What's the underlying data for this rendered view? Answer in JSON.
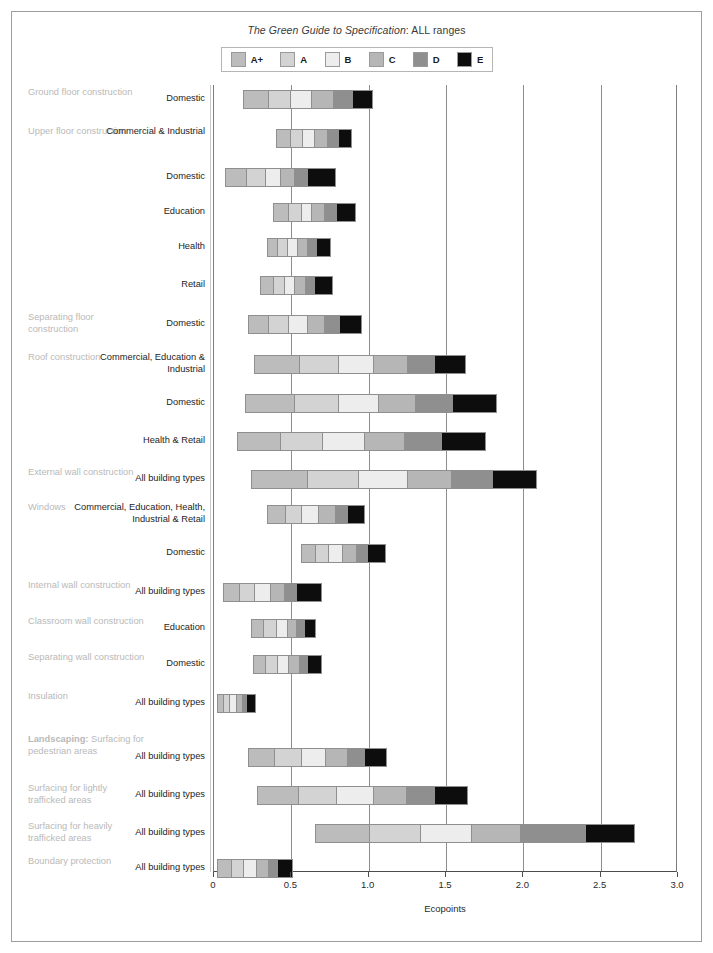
{
  "title": {
    "italic_part": "The Green Guide to Specification",
    "rest_part": ": ALL ranges"
  },
  "legend": {
    "items": [
      {
        "label": "A+",
        "color": "#bcbcbc"
      },
      {
        "label": "A",
        "color": "#d3d3d3"
      },
      {
        "label": "B",
        "color": "#ededed"
      },
      {
        "label": "C",
        "color": "#b6b6b6"
      },
      {
        "label": "D",
        "color": "#8f8f8f"
      },
      {
        "label": "E",
        "color": "#0d0d0d"
      }
    ]
  },
  "axis": {
    "label": "Ecopoints",
    "ticks": [
      "0",
      "0.5",
      "1.0",
      "1.5",
      "2.0",
      "2.5",
      "3.0"
    ],
    "min": 0,
    "max": 3.0
  },
  "chart_data": {
    "type": "bar",
    "orientation": "horizontal",
    "stacked": true,
    "title": "The Green Guide to Specification: ALL ranges",
    "xlabel": "Ecopoints",
    "ylabel": "",
    "xlim": [
      0,
      3.0
    ],
    "grid": true,
    "legend_position": "top",
    "series": [
      {
        "name": "A+",
        "color": "#bcbcbc"
      },
      {
        "name": "A",
        "color": "#d3d3d3"
      },
      {
        "name": "B",
        "color": "#ededed"
      },
      {
        "name": "C",
        "color": "#b6b6b6"
      },
      {
        "name": "D",
        "color": "#8f8f8f"
      },
      {
        "name": "E",
        "color": "#0d0d0d"
      }
    ],
    "rows": [
      {
        "category": "Ground floor construction",
        "subcategory": "Domestic",
        "start": 0.19,
        "boundaries": [
          0.19,
          0.35,
          0.49,
          0.63,
          0.77,
          0.89,
          1.03
        ],
        "end": 1.03
      },
      {
        "category": "Upper floor construction",
        "subcategory": "Commercial & Industrial",
        "start": 0.4,
        "boundaries": [
          0.4,
          0.49,
          0.57,
          0.65,
          0.73,
          0.8,
          0.89
        ],
        "end": 0.89
      },
      {
        "category": "",
        "subcategory": "Domestic",
        "start": 0.07,
        "boundaries": [
          0.07,
          0.21,
          0.33,
          0.43,
          0.52,
          0.6,
          0.79
        ],
        "end": 0.79
      },
      {
        "category": "",
        "subcategory": "Education",
        "start": 0.38,
        "boundaries": [
          0.38,
          0.48,
          0.56,
          0.63,
          0.71,
          0.79,
          0.92
        ],
        "end": 0.92
      },
      {
        "category": "",
        "subcategory": "Health",
        "start": 0.34,
        "boundaries": [
          0.34,
          0.41,
          0.47,
          0.54,
          0.6,
          0.66,
          0.76
        ],
        "end": 0.76
      },
      {
        "category": "",
        "subcategory": "Retail",
        "start": 0.3,
        "boundaries": [
          0.3,
          0.38,
          0.45,
          0.52,
          0.59,
          0.65,
          0.77
        ],
        "end": 0.77
      },
      {
        "category": "Separating floor construction",
        "subcategory": "Domestic",
        "start": 0.22,
        "boundaries": [
          0.22,
          0.35,
          0.48,
          0.6,
          0.71,
          0.81,
          0.96
        ],
        "end": 0.96
      },
      {
        "category": "Roof construction",
        "subcategory": "Commercial, Education & Industrial",
        "start": 0.26,
        "boundaries": [
          0.26,
          0.55,
          0.8,
          1.03,
          1.25,
          1.42,
          1.63
        ],
        "end": 1.63
      },
      {
        "category": "",
        "subcategory": "Domestic",
        "start": 0.2,
        "boundaries": [
          0.2,
          0.52,
          0.8,
          1.06,
          1.3,
          1.54,
          1.83
        ],
        "end": 1.83
      },
      {
        "category": "",
        "subcategory": "Health & Retail",
        "start": 0.15,
        "boundaries": [
          0.15,
          0.43,
          0.7,
          0.97,
          1.23,
          1.47,
          1.76
        ],
        "end": 1.76
      },
      {
        "category": "External wall construction",
        "subcategory": "All building types",
        "start": 0.24,
        "boundaries": [
          0.24,
          0.6,
          0.93,
          1.25,
          1.53,
          1.8,
          2.09
        ],
        "end": 2.09
      },
      {
        "category": "Windows",
        "subcategory": "Commercial, Education, Health, Industrial & Retail",
        "start": 0.34,
        "boundaries": [
          0.34,
          0.46,
          0.56,
          0.67,
          0.78,
          0.86,
          0.98
        ],
        "end": 0.98
      },
      {
        "category": "",
        "subcategory": "Domestic",
        "start": 0.56,
        "boundaries": [
          0.56,
          0.65,
          0.74,
          0.83,
          0.92,
          0.99,
          1.11
        ],
        "end": 1.11
      },
      {
        "category": "Internal wall construction",
        "subcategory": "All building types",
        "start": 0.06,
        "boundaries": [
          0.06,
          0.16,
          0.26,
          0.36,
          0.45,
          0.53,
          0.7
        ],
        "end": 0.7
      },
      {
        "category": "Classroom wall construction",
        "subcategory": "Education",
        "start": 0.24,
        "boundaries": [
          0.24,
          0.32,
          0.4,
          0.47,
          0.53,
          0.58,
          0.66
        ],
        "end": 0.66
      },
      {
        "category": "Separating wall construction",
        "subcategory": "Domestic",
        "start": 0.25,
        "boundaries": [
          0.25,
          0.33,
          0.41,
          0.48,
          0.55,
          0.6,
          0.7
        ],
        "end": 0.7
      },
      {
        "category": "Insulation",
        "subcategory": "All building types",
        "start": 0.02,
        "boundaries": [
          0.02,
          0.06,
          0.1,
          0.14,
          0.18,
          0.21,
          0.27
        ],
        "end": 0.27
      },
      {
        "category": "Landscaping: Surfacing for pedestrian areas",
        "category_lead": "Landscaping:",
        "subcategory": "All building types",
        "start": 0.22,
        "boundaries": [
          0.22,
          0.39,
          0.56,
          0.72,
          0.86,
          0.97,
          1.12
        ],
        "end": 1.12
      },
      {
        "category": "Surfacing for lightly trafficked areas",
        "subcategory": "All building types",
        "start": 0.28,
        "boundaries": [
          0.28,
          0.54,
          0.79,
          1.03,
          1.24,
          1.42,
          1.64
        ],
        "end": 1.64
      },
      {
        "category": "Surfacing for heavily trafficked areas",
        "subcategory": "All building types",
        "start": 0.65,
        "boundaries": [
          0.65,
          1.0,
          1.33,
          1.66,
          1.98,
          2.4,
          2.72
        ],
        "end": 2.72
      },
      {
        "category": "Boundary protection",
        "subcategory": "All building types",
        "start": 0.02,
        "boundaries": [
          0.02,
          0.11,
          0.19,
          0.27,
          0.35,
          0.41,
          0.51
        ],
        "end": 0.51
      }
    ]
  }
}
